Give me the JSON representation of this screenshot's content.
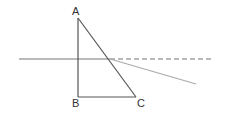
{
  "diagram": {
    "type": "geometry-triangle-with-ray",
    "points": {
      "A": {
        "label": "A",
        "x": 78,
        "y": 18
      },
      "B": {
        "label": "B",
        "x": 78,
        "y": 97
      },
      "C": {
        "label": "C",
        "x": 136,
        "y": 97
      },
      "P": {
        "x": 110,
        "y": 59
      }
    },
    "labels": [
      {
        "id": "A",
        "text": "A",
        "x": 72,
        "y": 15
      },
      {
        "id": "B",
        "text": "B",
        "x": 72,
        "y": 107
      },
      {
        "id": "C",
        "text": "C",
        "x": 138,
        "y": 107
      }
    ],
    "colors": {
      "triangle": "#555555",
      "horizontal_line": "#777777",
      "dashed_line": "#777777",
      "refracted_ray": "#aaaaaa"
    }
  }
}
